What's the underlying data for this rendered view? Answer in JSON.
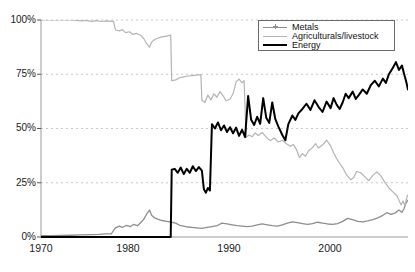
{
  "chart_data": {
    "type": "line",
    "title": "",
    "xlabel": "",
    "ylabel": "",
    "xlim": [
      1970,
      2006.5
    ],
    "ylim": [
      0,
      100
    ],
    "grid": true,
    "grid_style": "dashed-horizontal",
    "legend_position": "top-right",
    "xticks": [
      1970,
      1980,
      1990,
      2000
    ],
    "xtick_labels": [
      "1970",
      "1980",
      "1990",
      "2000"
    ],
    "yticks": [
      0,
      25,
      50,
      75,
      100
    ],
    "ytick_labels": [
      "0%",
      "25%",
      "50%",
      "75%",
      "100%"
    ],
    "series": [
      {
        "name": "Metals",
        "color": "#8e8e8e",
        "width": 1.3,
        "points": [
          [
            1970.0,
            0.6
          ],
          [
            1971.0,
            0.6
          ],
          [
            1972.0,
            0.7
          ],
          [
            1973.0,
            0.8
          ],
          [
            1974.0,
            1.0
          ],
          [
            1975.0,
            1.1
          ],
          [
            1975.8,
            1.2
          ],
          [
            1976.4,
            1.4
          ],
          [
            1977.0,
            1.5
          ],
          [
            1977.4,
            4.2
          ],
          [
            1977.8,
            5.0
          ],
          [
            1978.1,
            4.4
          ],
          [
            1978.5,
            5.4
          ],
          [
            1978.9,
            4.8
          ],
          [
            1979.2,
            5.8
          ],
          [
            1979.6,
            5.2
          ],
          [
            1979.9,
            6.6
          ],
          [
            1980.2,
            8.0
          ],
          [
            1980.5,
            10.5
          ],
          [
            1980.8,
            12.4
          ],
          [
            1981.0,
            10.0
          ],
          [
            1981.3,
            8.8
          ],
          [
            1981.6,
            8.2
          ],
          [
            1982.0,
            7.6
          ],
          [
            1982.5,
            7.2
          ],
          [
            1983.0,
            6.8
          ],
          [
            1983.4,
            6.4
          ],
          [
            1983.8,
            5.4
          ],
          [
            1984.2,
            5.0
          ],
          [
            1984.6,
            4.6
          ],
          [
            1985.0,
            4.4
          ],
          [
            1985.5,
            4.2
          ],
          [
            1986.0,
            4.0
          ],
          [
            1986.5,
            4.4
          ],
          [
            1987.0,
            4.8
          ],
          [
            1987.5,
            5.2
          ],
          [
            1988.0,
            6.4
          ],
          [
            1988.5,
            6.0
          ],
          [
            1989.0,
            5.6
          ],
          [
            1989.5,
            5.2
          ],
          [
            1990.0,
            5.0
          ],
          [
            1990.5,
            4.8
          ],
          [
            1991.0,
            5.0
          ],
          [
            1991.5,
            5.6
          ],
          [
            1992.0,
            6.0
          ],
          [
            1992.5,
            5.6
          ],
          [
            1993.0,
            5.2
          ],
          [
            1993.5,
            5.0
          ],
          [
            1994.0,
            5.6
          ],
          [
            1994.5,
            6.4
          ],
          [
            1995.0,
            7.0
          ],
          [
            1995.5,
            6.6
          ],
          [
            1996.0,
            6.2
          ],
          [
            1996.5,
            5.8
          ],
          [
            1997.0,
            6.2
          ],
          [
            1997.5,
            6.8
          ],
          [
            1998.0,
            6.4
          ],
          [
            1998.5,
            6.0
          ],
          [
            1999.0,
            5.8
          ],
          [
            1999.5,
            6.2
          ],
          [
            2000.0,
            7.2
          ],
          [
            2000.5,
            8.6
          ],
          [
            2001.0,
            8.0
          ],
          [
            2001.5,
            7.2
          ],
          [
            2002.0,
            7.0
          ],
          [
            2002.5,
            7.4
          ],
          [
            2003.0,
            8.0
          ],
          [
            2003.5,
            8.8
          ],
          [
            2004.0,
            10.0
          ],
          [
            2004.4,
            11.2
          ],
          [
            2004.8,
            10.4
          ],
          [
            2005.2,
            11.0
          ],
          [
            2005.6,
            12.4
          ],
          [
            2005.9,
            11.4
          ],
          [
            2006.1,
            13.0
          ],
          [
            2006.3,
            15.6
          ],
          [
            2006.5,
            17.0
          ]
        ]
      },
      {
        "name": "Agriculturals/livestock",
        "color": "#b4b4b4",
        "width": 1.2,
        "points": [
          [
            1970.0,
            100
          ],
          [
            1973.0,
            100
          ],
          [
            1974.0,
            99.6
          ],
          [
            1974.5,
            99.8
          ],
          [
            1975.0,
            99.4
          ],
          [
            1975.5,
            99.7
          ],
          [
            1976.0,
            99.3
          ],
          [
            1976.5,
            99.6
          ],
          [
            1977.0,
            99.4
          ],
          [
            1977.2,
            99.5
          ],
          [
            1977.4,
            95.4
          ],
          [
            1977.8,
            95.0
          ],
          [
            1978.1,
            95.6
          ],
          [
            1978.4,
            94.2
          ],
          [
            1978.8,
            94.6
          ],
          [
            1979.1,
            93.4
          ],
          [
            1979.5,
            93.8
          ],
          [
            1979.9,
            93.0
          ],
          [
            1980.2,
            91.6
          ],
          [
            1980.5,
            89.2
          ],
          [
            1980.8,
            87.4
          ],
          [
            1981.0,
            89.8
          ],
          [
            1981.3,
            91.0
          ],
          [
            1981.6,
            91.6
          ],
          [
            1982.0,
            92.2
          ],
          [
            1982.5,
            92.6
          ],
          [
            1982.9,
            93.0
          ],
          [
            1983.0,
            72.0
          ],
          [
            1983.4,
            72.4
          ],
          [
            1983.8,
            73.4
          ],
          [
            1984.2,
            73.8
          ],
          [
            1984.6,
            74.2
          ],
          [
            1985.0,
            74.4
          ],
          [
            1985.5,
            74.6
          ],
          [
            1985.9,
            74.8
          ],
          [
            1986.0,
            63.0
          ],
          [
            1986.3,
            62.0
          ],
          [
            1986.6,
            65.4
          ],
          [
            1986.9,
            63.2
          ],
          [
            1987.2,
            66.0
          ],
          [
            1987.5,
            64.4
          ],
          [
            1987.8,
            67.0
          ],
          [
            1988.1,
            65.2
          ],
          [
            1988.4,
            62.8
          ],
          [
            1988.8,
            63.6
          ],
          [
            1989.1,
            66.0
          ],
          [
            1989.4,
            71.4
          ],
          [
            1989.7,
            72.8
          ],
          [
            1990.0,
            71.0
          ],
          [
            1990.2,
            72.0
          ],
          [
            1990.4,
            46.0
          ],
          [
            1990.7,
            47.0
          ],
          [
            1991.0,
            46.2
          ],
          [
            1991.3,
            48.0
          ],
          [
            1991.6,
            46.8
          ],
          [
            1992.0,
            48.2
          ],
          [
            1992.4,
            46.0
          ],
          [
            1992.8,
            44.4
          ],
          [
            1993.2,
            45.6
          ],
          [
            1993.6,
            43.8
          ],
          [
            1994.0,
            44.6
          ],
          [
            1994.4,
            43.0
          ],
          [
            1994.8,
            41.8
          ],
          [
            1995.1,
            42.6
          ],
          [
            1995.4,
            40.4
          ],
          [
            1995.7,
            36.6
          ],
          [
            1996.0,
            38.4
          ],
          [
            1996.3,
            37.2
          ],
          [
            1996.6,
            39.6
          ],
          [
            1997.0,
            41.2
          ],
          [
            1997.3,
            43.0
          ],
          [
            1997.6,
            41.0
          ],
          [
            1998.0,
            42.4
          ],
          [
            1998.4,
            44.6
          ],
          [
            1998.8,
            42.0
          ],
          [
            1999.1,
            38.8
          ],
          [
            1999.4,
            36.2
          ],
          [
            1999.7,
            34.0
          ],
          [
            2000.0,
            32.0
          ],
          [
            2000.4,
            28.6
          ],
          [
            2000.8,
            26.4
          ],
          [
            2001.1,
            27.4
          ],
          [
            2001.4,
            30.2
          ],
          [
            2001.8,
            29.6
          ],
          [
            2002.2,
            27.8
          ],
          [
            2002.6,
            26.0
          ],
          [
            2003.0,
            28.4
          ],
          [
            2003.4,
            30.0
          ],
          [
            2003.8,
            28.2
          ],
          [
            2004.2,
            25.2
          ],
          [
            2004.6,
            22.6
          ],
          [
            2005.0,
            20.8
          ],
          [
            2005.4,
            19.0
          ],
          [
            2005.8,
            14.8
          ],
          [
            2006.0,
            16.6
          ],
          [
            2006.2,
            14.4
          ],
          [
            2006.4,
            18.6
          ],
          [
            2006.5,
            19.4
          ]
        ]
      },
      {
        "name": "Energy",
        "color": "#000000",
        "width": 2.0,
        "points": [
          [
            1970.0,
            0
          ],
          [
            1977.0,
            0
          ],
          [
            1977.4,
            0
          ],
          [
            1982.9,
            0
          ],
          [
            1983.0,
            31.0
          ],
          [
            1983.3,
            31.4
          ],
          [
            1983.6,
            29.6
          ],
          [
            1983.9,
            32.0
          ],
          [
            1984.2,
            29.0
          ],
          [
            1984.5,
            31.4
          ],
          [
            1984.8,
            29.6
          ],
          [
            1985.1,
            32.6
          ],
          [
            1985.4,
            30.4
          ],
          [
            1985.7,
            32.2
          ],
          [
            1986.0,
            30.6
          ],
          [
            1986.2,
            22.0
          ],
          [
            1986.4,
            20.4
          ],
          [
            1986.6,
            22.6
          ],
          [
            1986.8,
            21.4
          ],
          [
            1987.0,
            52.0
          ],
          [
            1987.3,
            50.0
          ],
          [
            1987.6,
            52.8
          ],
          [
            1987.9,
            49.2
          ],
          [
            1988.2,
            51.4
          ],
          [
            1988.5,
            48.4
          ],
          [
            1988.8,
            50.6
          ],
          [
            1989.1,
            47.8
          ],
          [
            1989.4,
            50.4
          ],
          [
            1989.7,
            46.6
          ],
          [
            1990.0,
            49.4
          ],
          [
            1990.3,
            46.0
          ],
          [
            1990.6,
            65.0
          ],
          [
            1990.9,
            54.0
          ],
          [
            1991.2,
            51.6
          ],
          [
            1991.5,
            55.4
          ],
          [
            1991.8,
            52.2
          ],
          [
            1992.1,
            64.0
          ],
          [
            1992.4,
            55.0
          ],
          [
            1992.7,
            52.6
          ],
          [
            1993.0,
            62.0
          ],
          [
            1993.3,
            54.4
          ],
          [
            1993.6,
            51.0
          ],
          [
            1994.0,
            47.0
          ],
          [
            1994.3,
            44.6
          ],
          [
            1994.6,
            52.0
          ],
          [
            1995.0,
            56.0
          ],
          [
            1995.3,
            54.0
          ],
          [
            1995.6,
            57.0
          ],
          [
            1996.0,
            59.0
          ],
          [
            1996.4,
            61.4
          ],
          [
            1996.8,
            58.6
          ],
          [
            1997.2,
            63.0
          ],
          [
            1997.6,
            60.0
          ],
          [
            1998.0,
            57.6
          ],
          [
            1998.4,
            62.4
          ],
          [
            1998.8,
            59.4
          ],
          [
            1999.1,
            64.0
          ],
          [
            1999.4,
            61.0
          ],
          [
            1999.7,
            59.0
          ],
          [
            2000.0,
            62.0
          ],
          [
            2000.3,
            66.0
          ],
          [
            2000.6,
            64.0
          ],
          [
            2001.0,
            67.0
          ],
          [
            2001.3,
            63.6
          ],
          [
            2001.6,
            65.4
          ],
          [
            2002.0,
            68.0
          ],
          [
            2002.4,
            66.0
          ],
          [
            2002.8,
            70.0
          ],
          [
            2003.2,
            72.0
          ],
          [
            2003.6,
            69.4
          ],
          [
            2004.0,
            73.0
          ],
          [
            2004.3,
            71.0
          ],
          [
            2004.6,
            75.0
          ],
          [
            2005.0,
            78.0
          ],
          [
            2005.3,
            80.6
          ],
          [
            2005.6,
            77.0
          ],
          [
            2005.9,
            79.0
          ],
          [
            2006.1,
            75.4
          ],
          [
            2006.3,
            72.0
          ],
          [
            2006.5,
            68.0
          ]
        ]
      }
    ]
  },
  "legend": {
    "items": [
      {
        "label": "Metals",
        "style": "line-with-marker",
        "color": "#8e8e8e"
      },
      {
        "label": "Agriculturals/livestock",
        "style": "thin-line",
        "color": "#b4b4b4"
      },
      {
        "label": "Energy",
        "style": "thick-line",
        "color": "#000000"
      }
    ]
  },
  "axes": {
    "y_labels": [
      "100%",
      "75%",
      "50%",
      "25%",
      "0%"
    ],
    "x_labels": [
      "1970",
      "1980",
      "1990",
      "2000"
    ]
  }
}
